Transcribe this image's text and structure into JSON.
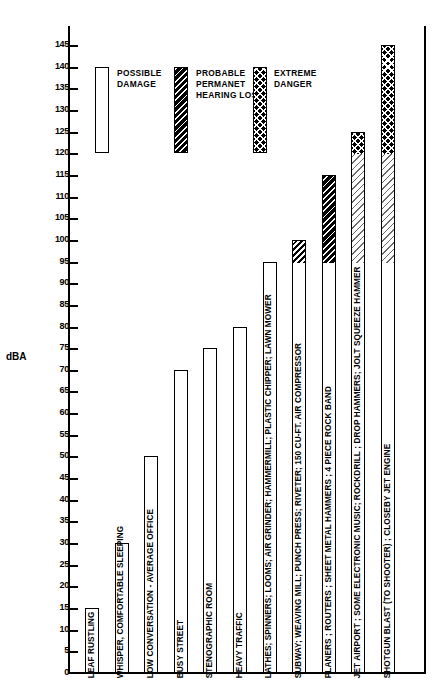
{
  "chart_data": {
    "type": "bar",
    "title": "",
    "xlabel": "",
    "ylabel": "dBA",
    "ylim": [
      0,
      150
    ],
    "ytick_step": 5,
    "grid": false,
    "yticks": [
      145,
      140,
      135,
      130,
      125,
      120,
      115,
      110,
      105,
      100,
      95,
      90,
      85,
      80,
      75,
      70,
      65,
      60,
      55,
      50,
      45,
      40,
      35,
      30,
      25,
      20,
      15,
      10,
      5,
      0
    ],
    "legend_position": "top-center",
    "categories": [
      "LEAF RUSTLING",
      "WHISPER, COMFORTABLE SLEEPING",
      "LOW CONVERSATION - AVERAGE OFFICE",
      "BUSY STREET",
      "STENOGRAPHIC ROOM",
      "HEAVY TRAFFIC",
      "LATHES; SPINNERS; LOOMS; AIR GRINDER; HAMMERMILL; PLASTIC CHIPPER; LAWN MOWER",
      "SUBWAY; WEAVING MILL; PUNCH PRESS; RIVETER; 150 CU-FT. AIR COMPRESSOR",
      "PLANERS ; ROUTERS ; SHEET METAL HAMMERS ; 4 PIECE ROCK BAND",
      "JET AIRPORT ; SOME ELECTRONIC MUSIC; ROCKDRILL ; DROP HAMMERS; JOLT SQUEEZE HAMMER",
      "SHOTGUN BLAST (TO SHOOTER) ; CLOSEBY JET ENGINE"
    ],
    "values": [
      15,
      30,
      50,
      70,
      75,
      80,
      95,
      100,
      115,
      125,
      145
    ],
    "bars": [
      {
        "label": "LEAF RUSTLING",
        "value": 15,
        "segments": [
          {
            "from": 0,
            "to": 15,
            "fill": "f-white",
            "zone": "safe"
          }
        ]
      },
      {
        "label": "WHISPER, COMFORTABLE SLEEPING",
        "value": 30,
        "segments": [
          {
            "from": 0,
            "to": 30,
            "fill": "f-white",
            "zone": "safe"
          }
        ]
      },
      {
        "label": "LOW CONVERSATION - AVERAGE OFFICE",
        "value": 50,
        "segments": [
          {
            "from": 0,
            "to": 50,
            "fill": "f-white",
            "zone": "safe"
          }
        ]
      },
      {
        "label": "BUSY STREET",
        "value": 70,
        "segments": [
          {
            "from": 0,
            "to": 70,
            "fill": "f-white",
            "zone": "safe"
          }
        ]
      },
      {
        "label": "STENOGRAPHIC ROOM",
        "value": 75,
        "segments": [
          {
            "from": 0,
            "to": 75,
            "fill": "f-white",
            "zone": "safe"
          }
        ]
      },
      {
        "label": "HEAVY TRAFFIC",
        "value": 80,
        "segments": [
          {
            "from": 0,
            "to": 80,
            "fill": "f-white",
            "zone": "safe"
          }
        ]
      },
      {
        "label": "LATHES; SPINNERS; LOOMS; AIR GRINDER; HAMMERMILL; PLASTIC CHIPPER; LAWN MOWER",
        "value": 95,
        "segments": [
          {
            "from": 0,
            "to": 95,
            "fill": "f-white",
            "zone": "possible-damage"
          }
        ]
      },
      {
        "label": "SUBWAY; WEAVING MILL; PUNCH PRESS; RIVETER; 150 CU-FT. AIR COMPRESSOR",
        "value": 100,
        "segments": [
          {
            "from": 0,
            "to": 95,
            "fill": "f-white",
            "zone": "possible-damage"
          },
          {
            "from": 95,
            "to": 100,
            "fill": "f-diag",
            "zone": "probable-permanent-hearing-loss"
          }
        ]
      },
      {
        "label": "PLANERS ; ROUTERS ; SHEET METAL HAMMERS ; 4 PIECE ROCK BAND",
        "value": 115,
        "segments": [
          {
            "from": 0,
            "to": 95,
            "fill": "f-white",
            "zone": "possible-damage"
          },
          {
            "from": 95,
            "to": 115,
            "fill": "f-diag-dark",
            "zone": "probable-permanent-hearing-loss"
          }
        ]
      },
      {
        "label": "JET AIRPORT ; SOME ELECTRONIC MUSIC; ROCKDRILL ; DROP HAMMERS; JOLT SQUEEZE HAMMER",
        "value": 125,
        "segments": [
          {
            "from": 0,
            "to": 95,
            "fill": "f-white",
            "zone": "possible-damage"
          },
          {
            "from": 95,
            "to": 120,
            "fill": "f-diag-light",
            "zone": "probable-permanent-hearing-loss"
          },
          {
            "from": 120,
            "to": 125,
            "fill": "f-cross",
            "zone": "extreme-danger"
          }
        ]
      },
      {
        "label": "SHOTGUN BLAST (TO SHOOTER) ; CLOSEBY JET ENGINE",
        "value": 145,
        "segments": [
          {
            "from": 0,
            "to": 95,
            "fill": "f-white",
            "zone": "possible-damage"
          },
          {
            "from": 95,
            "to": 120,
            "fill": "f-diag-light",
            "zone": "probable-permanent-hearing-loss"
          },
          {
            "from": 120,
            "to": 145,
            "fill": "f-cross",
            "zone": "extreme-danger"
          }
        ]
      }
    ],
    "legend": [
      {
        "name": "possible-damage",
        "label": "POSSIBLE\nDAMAGE",
        "fill": "f-white"
      },
      {
        "name": "probable-permanent-hearing-loss",
        "label": "PROBABLE\nPERMANET\nHEARING LOSS",
        "fill": "f-diag-dark"
      },
      {
        "name": "extreme-danger",
        "label": "EXTREME\nDANGER",
        "fill": "f-cross"
      }
    ]
  }
}
